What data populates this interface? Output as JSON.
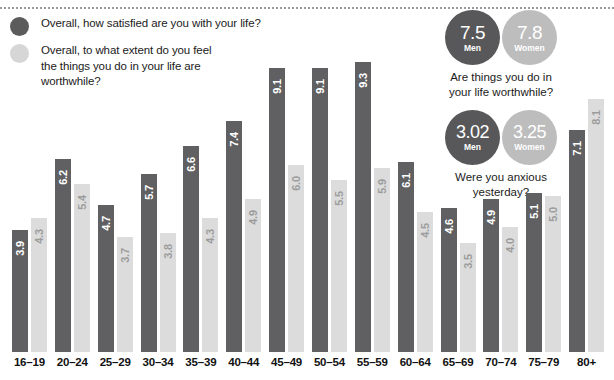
{
  "legend": {
    "items": [
      {
        "icon": "circle-dark-icon",
        "color": "#5b5b5b",
        "label": "Overall, how satisfied are you with your life?"
      },
      {
        "icon": "circle-light-icon",
        "color": "#d6d6d6",
        "label": "Overall, to what extent do you feel the things you do in your life are worthwhile?"
      }
    ]
  },
  "callouts": [
    {
      "caption": "Are things you do in your life worthwhile?",
      "men": {
        "value": "7.5",
        "label": "Men",
        "color": "#58585a"
      },
      "women": {
        "value": "7.8",
        "label": "Women",
        "color": "#bdbdbd"
      }
    },
    {
      "caption": "Were you anxious yesterday?",
      "men": {
        "value": "3.02",
        "label": "Men",
        "color": "#58585a"
      },
      "women": {
        "value": "3.25",
        "label": "Women",
        "color": "#bdbdbd"
      }
    }
  ],
  "chart_data": {
    "type": "bar",
    "title": "",
    "xlabel": "",
    "ylabel": "",
    "ylim": [
      0,
      10
    ],
    "grid": false,
    "legend_position": "top-left",
    "categories": [
      "16–19",
      "20–24",
      "25–29",
      "30–34",
      "35–39",
      "40–44",
      "45–49",
      "50–54",
      "55–59",
      "60–64",
      "65–69",
      "70–74",
      "75–79",
      "80+"
    ],
    "series": [
      {
        "name": "Overall, how satisfied are you with your life?",
        "color": "#606062",
        "values": [
          3.9,
          6.2,
          4.7,
          5.7,
          6.6,
          7.4,
          9.1,
          9.1,
          9.3,
          6.1,
          4.6,
          4.9,
          5.1,
          7.1
        ],
        "labels": [
          "3.9",
          "6.2",
          "4.7",
          "5.7",
          "6.6",
          "7.4",
          "9.1",
          "9.1",
          "9.3",
          "6.1",
          "4.6",
          "4.9",
          "5.1",
          "7.1"
        ]
      },
      {
        "name": "Overall, to what extent do you feel the things you do in your life are worthwhile?",
        "color": "#dcdcdc",
        "values": [
          4.3,
          5.4,
          3.7,
          3.8,
          4.3,
          4.9,
          6.0,
          5.5,
          5.9,
          4.5,
          3.5,
          4.0,
          5.0,
          8.1
        ],
        "labels": [
          "4.3",
          "5.4",
          "3.7",
          "3.8",
          "4.3",
          "4.9",
          "6.0",
          "5.5",
          "5.9",
          "4.5",
          "3.5",
          "4.0",
          "5.0",
          "8.1"
        ]
      }
    ]
  }
}
